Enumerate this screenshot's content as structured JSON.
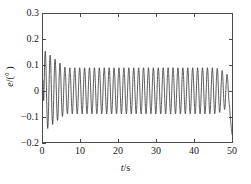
{
  "figure": {
    "background_color": "#ffffff",
    "frame_color": "#4a4a4a",
    "curve_color": "#2b2b2b"
  },
  "axes": {
    "x_title_plain": "t/s",
    "x_title_var": "t",
    "x_title_unit": "/s",
    "y_title_plain": "e/(°)",
    "y_title_var": "e",
    "y_title_unit": "/(° )"
  },
  "chart_data": {
    "type": "line",
    "title": "",
    "subtitle": "",
    "xlabel": "t/s",
    "ylabel": "e/(°)",
    "xlim": [
      0,
      50
    ],
    "ylim": [
      -0.2,
      0.3
    ],
    "xticks": [
      0,
      10,
      20,
      30,
      40,
      50
    ],
    "xtick_labels": [
      "0",
      "10",
      "20",
      "30",
      "40",
      "50"
    ],
    "yticks": [
      -0.2,
      -0.1,
      0,
      0.1,
      0.2,
      0.3
    ],
    "ytick_labels": [
      "−0.2",
      "−0.1",
      "0",
      "0.1",
      "0.2",
      "0.3"
    ],
    "grid": false,
    "legend": false,
    "legend_position": "none",
    "series": [
      {
        "name": "e",
        "color": "#2b2b2b",
        "line_width": 0.8,
        "description": "Oscillating tracking-error signal: starts near 0.04, overshoots to a first peak of about 0.155 at t~0.6 s, then settles into a steady sinusoidal oscillation of roughly ±0.09° with a period of about 1.3 s (~0.77 Hz); amplitude decays slightly after t~45 s and the trace ends with a sharp downward excursion to about −0.17° at t=50 s.",
        "steady_amplitude": 0.09,
        "period_s": 1.3,
        "frequency_hz": 0.77,
        "first_peak_value": 0.155,
        "first_peak_time": 0.6,
        "start_value": 0.04,
        "end_value": -0.17,
        "decay_start_time": 45.0,
        "decay_end_amplitude": 0.055,
        "points_x": [
          0,
          0.6,
          1.3,
          1.9,
          2.6,
          3.2,
          3.9,
          4.5,
          5.2,
          5.8,
          6.5,
          7.1,
          7.8,
          8.4,
          9.1,
          9.7,
          10.4,
          11,
          11.7,
          12.3,
          13,
          13.6,
          14.3,
          14.9,
          15.6,
          16.2,
          16.9,
          17.5,
          18.2,
          18.8,
          19.5,
          20.1,
          20.8,
          21.4,
          22.1,
          22.7,
          23.4,
          24,
          24.7,
          25.3,
          26,
          26.6,
          27.3,
          27.9,
          28.6,
          29.2,
          29.9,
          30.5,
          31.2,
          31.8,
          32.5,
          33.1,
          33.8,
          34.4,
          35.1,
          35.7,
          36.4,
          37,
          37.7,
          38.3,
          39,
          39.6,
          40.3,
          40.9,
          41.6,
          42.2,
          42.9,
          43.5,
          44.2,
          44.8,
          45.5,
          46.1,
          46.8,
          47.4,
          48.1,
          48.7,
          49.4,
          50
        ],
        "points_y": [
          0.04,
          0.155,
          -0.05,
          0.105,
          -0.075,
          0.095,
          -0.085,
          0.092,
          -0.088,
          0.09,
          -0.09,
          0.09,
          -0.09,
          0.09,
          -0.09,
          0.09,
          -0.09,
          0.09,
          -0.09,
          0.09,
          -0.09,
          0.09,
          -0.09,
          0.09,
          -0.09,
          0.09,
          -0.09,
          0.09,
          -0.09,
          0.09,
          -0.09,
          0.09,
          -0.09,
          0.09,
          -0.09,
          0.09,
          -0.09,
          0.09,
          -0.09,
          0.09,
          -0.09,
          0.09,
          -0.09,
          0.09,
          -0.09,
          0.09,
          -0.09,
          0.09,
          -0.09,
          0.09,
          -0.09,
          0.09,
          -0.09,
          0.09,
          -0.09,
          0.09,
          -0.09,
          0.09,
          -0.09,
          0.09,
          -0.09,
          0.09,
          -0.09,
          0.088,
          -0.086,
          0.085,
          -0.082,
          0.08,
          -0.076,
          0.072,
          -0.066,
          0.06,
          -0.055,
          0.05,
          -0.04,
          0.03,
          -0.17
        ]
      }
    ]
  }
}
